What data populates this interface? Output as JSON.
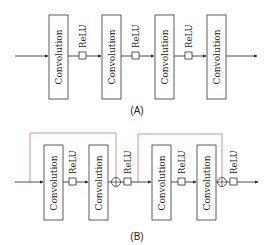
{
  "diagram": {
    "panel_a": {
      "caption": "(A)",
      "blocks": [
        {
          "label": "Convolution"
        },
        {
          "label": "Convolution"
        },
        {
          "label": "Convolution"
        },
        {
          "label": "Convolution"
        }
      ],
      "activations": [
        {
          "label": "ReLU"
        },
        {
          "label": "ReLU"
        },
        {
          "label": "ReLU"
        }
      ]
    },
    "panel_b": {
      "caption": "(B)",
      "blocks": [
        {
          "label": "Convolution"
        },
        {
          "label": "Convolution"
        },
        {
          "label": "Convolution"
        },
        {
          "label": "Convolution"
        }
      ],
      "activations": [
        {
          "label": "ReLU"
        },
        {
          "label": "ReLU"
        },
        {
          "label": "ReLU"
        },
        {
          "label": "ReLU"
        }
      ],
      "skip_connection_color": "#c47a7a",
      "sum_symbol": "⊕"
    },
    "colors": {
      "line": "#222222",
      "skip": "#c47a7a",
      "background": "#ffffff"
    }
  }
}
